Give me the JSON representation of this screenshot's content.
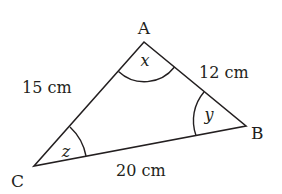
{
  "diagram": {
    "type": "triangle",
    "stroke_color": "#231f20",
    "vertices": [
      {
        "name": "A",
        "x": 144,
        "y": 42
      },
      {
        "name": "B",
        "x": 246,
        "y": 126
      },
      {
        "name": "C",
        "x": 34,
        "y": 166
      }
    ],
    "vertex_labels": {
      "A": "A",
      "B": "B",
      "C": "C"
    },
    "side_labels": {
      "AC": "15 cm",
      "AB": "12 cm",
      "BC": "20 cm"
    },
    "angle_labels": {
      "A": "x",
      "B": "y",
      "C": "z"
    }
  }
}
